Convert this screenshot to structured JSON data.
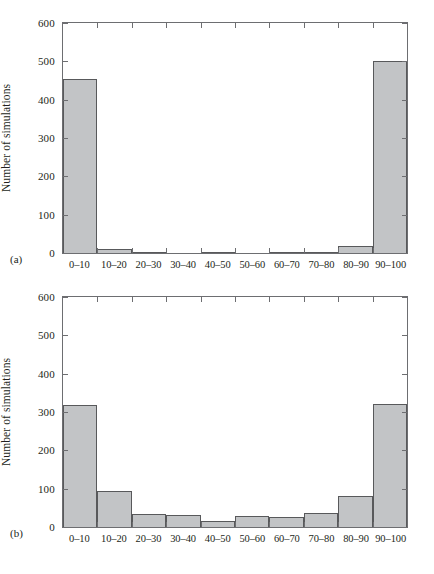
{
  "figure": {
    "panels": [
      {
        "letter": "(a)",
        "ylabel": "Number of simulations",
        "yticks": [
          0,
          100,
          200,
          300,
          400,
          500,
          600
        ]
      },
      {
        "letter": "(b)",
        "ylabel": "Number of simulations",
        "yticks": [
          0,
          100,
          200,
          300,
          400,
          500,
          600
        ]
      }
    ]
  },
  "chart_data": [
    {
      "type": "bar",
      "panel": "(a)",
      "title": "",
      "xlabel": "",
      "ylabel": "Number of simulations",
      "categories": [
        "0–10",
        "10–20",
        "20–30",
        "30–40",
        "40–50",
        "50–60",
        "60–70",
        "70–80",
        "80–90",
        "90–100"
      ],
      "values": [
        455,
        10,
        2,
        0,
        1,
        0,
        3,
        2,
        17,
        500
      ],
      "ylim": [
        0,
        600
      ],
      "ytick_labels": [
        "0",
        "100",
        "200",
        "300",
        "400",
        "500",
        "600"
      ],
      "grid": false,
      "legend": false,
      "bar_fill": "#c2c4c6",
      "bar_edge": "#58595b"
    },
    {
      "type": "bar",
      "panel": "(b)",
      "title": "",
      "xlabel": "",
      "ylabel": "Number of simulations",
      "categories": [
        "0–10",
        "10–20",
        "20–30",
        "30–40",
        "40–50",
        "50–60",
        "60–70",
        "70–80",
        "80–90",
        "90–100"
      ],
      "values": [
        317,
        93,
        35,
        31,
        15,
        28,
        25,
        37,
        80,
        322
      ],
      "ylim": [
        0,
        600
      ],
      "ytick_labels": [
        "0",
        "100",
        "200",
        "300",
        "400",
        "500",
        "600"
      ],
      "grid": false,
      "legend": false,
      "bar_fill": "#c2c4c6",
      "bar_edge": "#58595b"
    }
  ]
}
